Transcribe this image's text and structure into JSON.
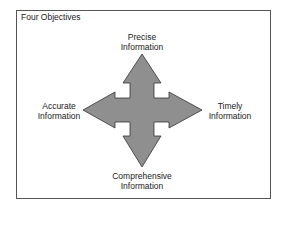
{
  "diagram": {
    "title": "Four Objectives",
    "center_shape": "four-way-arrow",
    "arrow_fill": "#8f8f8f",
    "arrow_stroke": "#333333",
    "labels": {
      "top": [
        "Precise",
        "Information"
      ],
      "left": [
        "Accurate",
        "Information"
      ],
      "right": [
        "Timely",
        "Information"
      ],
      "bottom": [
        "Comprehensive",
        "Information"
      ]
    }
  }
}
